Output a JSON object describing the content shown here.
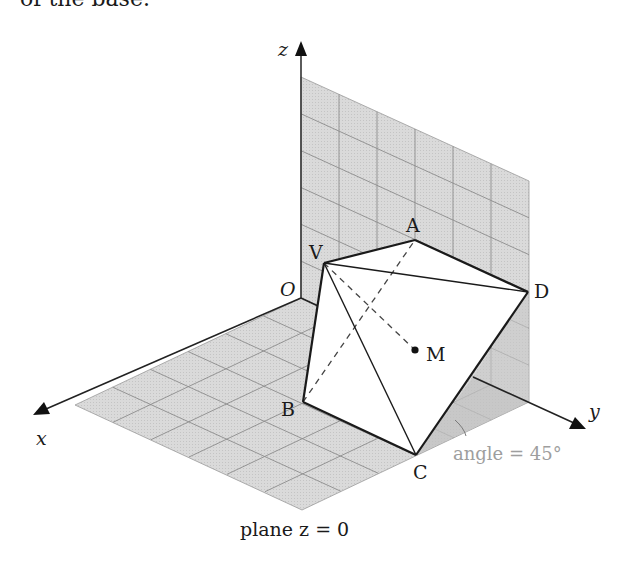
{
  "header": {
    "partial_text": "of the base."
  },
  "axes": {
    "x": {
      "label": "x"
    },
    "y": {
      "label": "y"
    },
    "z": {
      "label": "z"
    },
    "origin": {
      "label": "O"
    }
  },
  "points": {
    "V": {
      "label": "V"
    },
    "A": {
      "label": "A"
    },
    "B": {
      "label": "B"
    },
    "C": {
      "label": "C"
    },
    "D": {
      "label": "D"
    },
    "M": {
      "label": "M"
    }
  },
  "annotations": {
    "plane_label": "plane z = 0",
    "angle_label": "angle = 45°"
  },
  "colors": {
    "plane_fill": "#d6d6d6",
    "grid_line": "#8c8c8c",
    "edge": "#1a1a1a",
    "angle_text": "#9e9e9e",
    "shadow_wedge": "#bdbdbd"
  },
  "grid": {
    "divisions": 6
  }
}
